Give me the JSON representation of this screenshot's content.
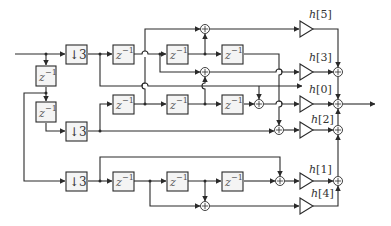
{
  "diagram": {
    "type": "polyphase FIR filter block diagram",
    "delay_label": {
      "base": "z",
      "exponent": "−1"
    },
    "downsample_label": {
      "arrow": "↓",
      "factor": "3"
    },
    "gains": [
      {
        "id": "h5",
        "label": "h[5]",
        "index": "5"
      },
      {
        "id": "h3",
        "label": "h[3]",
        "index": "3"
      },
      {
        "id": "h0",
        "label": "h[0]",
        "index": "0"
      },
      {
        "id": "h2",
        "label": "h[2]",
        "index": "2"
      },
      {
        "id": "h1",
        "label": "h[1]",
        "index": "1"
      },
      {
        "id": "h4",
        "label": "h[4]",
        "index": "4"
      }
    ],
    "nodes": {
      "downsamplers": 3,
      "delays": 11,
      "adders": 11,
      "multipliers": 6
    },
    "colors": {
      "stroke": "#2a2a2a",
      "box_fill": "#f4f4f4",
      "background": "#ffffff"
    }
  }
}
